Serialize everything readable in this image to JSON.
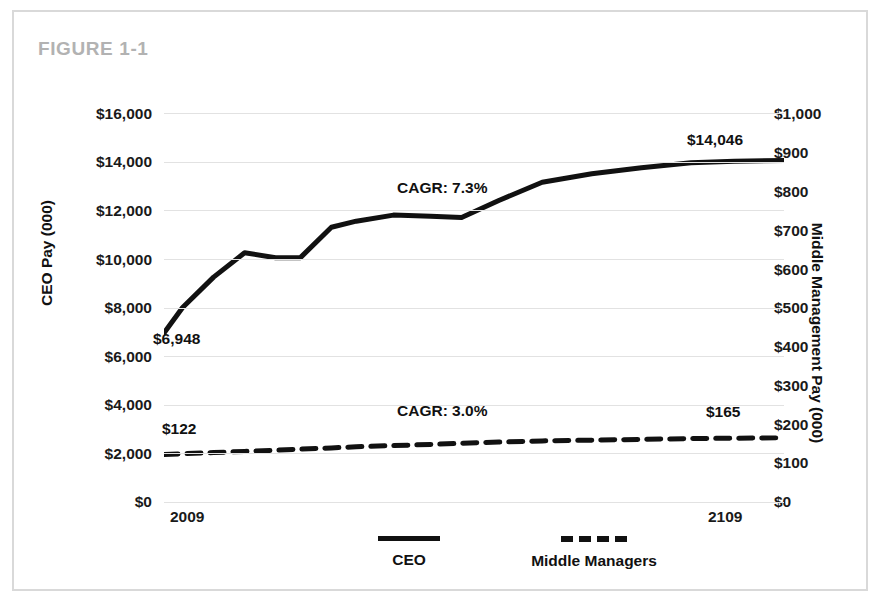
{
  "figure": {
    "title": "FIGURE 1-1"
  },
  "axes": {
    "left_title": "CEO Pay (000)",
    "right_title": "Middle Management Pay (000)",
    "left_ticks": [
      "$16,000",
      "$14,000",
      "$12,000",
      "$10,000",
      "$8,000",
      "$6,000",
      "$4,000",
      "$2,000",
      "$0"
    ],
    "right_ticks": [
      "$1,000",
      "$900",
      "$800",
      "$700",
      "$600",
      "$500",
      "$400",
      "$300",
      "$200",
      "$100",
      "$0"
    ],
    "x_ticks": [
      "2009",
      "2109"
    ]
  },
  "labels": {
    "ceo_start": "$6,948",
    "ceo_end": "$14,046",
    "mm_start": "$122",
    "mm_end": "$165",
    "ceo_cagr": "CAGR: 7.3%",
    "mm_cagr": "CAGR: 3.0%"
  },
  "legend": {
    "items": [
      {
        "label": "CEO",
        "style": "solid"
      },
      {
        "label": "Middle Managers",
        "style": "dashed"
      }
    ]
  },
  "colors": {
    "line": "#111111",
    "grid": "#e2e2e2",
    "frame": "#d9d9d9",
    "title": "#b2b2b2"
  },
  "chart_data": {
    "type": "line",
    "title": "FIGURE 1-1",
    "xlabel": "",
    "ylabel": "CEO Pay (000)",
    "y2label": "Middle Management Pay (000)",
    "grid": true,
    "legend_position": "bottom",
    "xlim": [
      2009,
      2109
    ],
    "ylim": [
      0,
      16000
    ],
    "y2lim": [
      0,
      1000
    ],
    "x_tick_labels": [
      "2009",
      "2109"
    ],
    "y_tick_values": [
      0,
      2000,
      4000,
      6000,
      8000,
      10000,
      12000,
      14000,
      16000
    ],
    "y2_tick_values": [
      0,
      100,
      200,
      300,
      400,
      500,
      600,
      700,
      800,
      900,
      1000
    ],
    "x": [
      2009,
      2012,
      2017,
      2022,
      2027,
      2031,
      2036,
      2040,
      2046,
      2052,
      2057,
      2063,
      2070,
      2078,
      2086,
      2094,
      2101,
      2109
    ],
    "series": [
      {
        "name": "CEO",
        "axis": "left",
        "style": "solid",
        "start_label": "$6,948",
        "end_label": "$14,046",
        "annotation": "CAGR: 7.3%",
        "cagr_percent": 7.3,
        "values": [
          6948,
          8000,
          9250,
          10250,
          10050,
          10050,
          11300,
          11550,
          11800,
          11750,
          11700,
          12400,
          13150,
          13500,
          13750,
          13950,
          14020,
          14046
        ]
      },
      {
        "name": "Middle Managers",
        "axis": "right",
        "style": "dashed",
        "start_label": "$122",
        "end_label": "$165",
        "annotation": "CAGR: 3.0%",
        "cagr_percent": 3.0,
        "values": [
          122,
          124,
          127,
          130,
          133,
          136,
          139,
          142,
          145,
          148,
          151,
          154,
          157,
          159,
          161,
          163,
          164,
          165
        ]
      }
    ]
  }
}
